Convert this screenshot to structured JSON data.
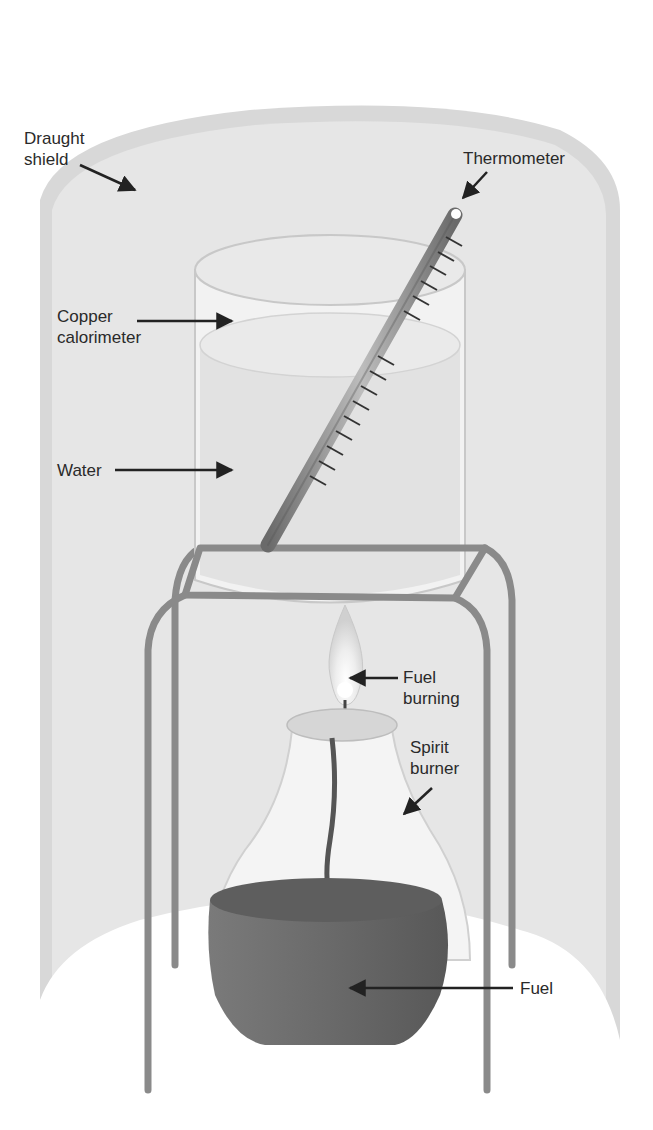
{
  "labels": {
    "draught_shield": "Draught\nshield",
    "thermometer": "Thermometer",
    "copper_calorimeter": "Copper\ncalorimeter",
    "water": "Water",
    "fuel_burning": "Fuel\nburning",
    "spirit_burner": "Spirit\nburner",
    "fuel": "Fuel"
  },
  "colors": {
    "background": "#ffffff",
    "shield_rim": "#d6d6d6",
    "shield_inner": "#e4e4e4",
    "calorimeter": "#f0f0f0",
    "water": "#e2e2e2",
    "stand": "#8a8a8a",
    "fuel": "#6e6e6e",
    "text": "#2a2a2a"
  }
}
